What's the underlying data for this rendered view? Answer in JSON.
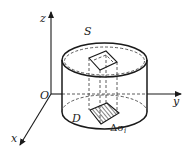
{
  "figure": {
    "type": "3d-cylinder-surface-projection",
    "labels": {
      "z_axis": "z",
      "y_axis": "y",
      "x_axis": "x",
      "origin": "O",
      "surface": "S",
      "region": "D",
      "area_element_symbol": "Δσ",
      "area_element_subscript": "i"
    },
    "colors": {
      "line": "#1a1a1a",
      "background": "#ffffff"
    }
  }
}
